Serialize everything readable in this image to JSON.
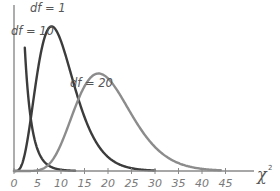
{
  "chart_data": {
    "type": "line",
    "title": "",
    "xlabel": "χ",
    "xlabel_superscript": "2",
    "ylabel": "",
    "xlim": [
      0,
      50
    ],
    "x_ticks": [
      0,
      5,
      10,
      15,
      20,
      25,
      30,
      35,
      40,
      45
    ],
    "grid": false,
    "legend": "inline labels",
    "series": [
      {
        "name": "df = 1",
        "df": 1,
        "color": "#3c3c3c",
        "label": "df = 1",
        "label_x": 87,
        "label_y": 16,
        "x_start": 2.3,
        "x_end": 13
      },
      {
        "name": "df = 10",
        "df": 10,
        "color": "#3c3c3c",
        "label": "df = 10",
        "label_x": 68,
        "label_y": 39,
        "x_start": 0,
        "x_end": 30
      },
      {
        "name": "df = 20",
        "df": 20,
        "color": "#8c8c8c",
        "label": "df = 20",
        "label_x": 127,
        "label_y": 91,
        "x_start": 0,
        "x_end": 44
      }
    ]
  },
  "layout": {
    "origin_x": 14,
    "origin_y": 171,
    "px_per_unit_x": 4.7,
    "px_per_unit_density": 1480,
    "axis_end_x": 254,
    "y_axis_top": 5,
    "axis_color": "#8a8a8a"
  }
}
